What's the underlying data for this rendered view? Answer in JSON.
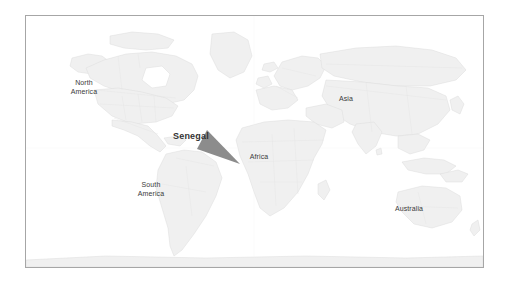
{
  "figure": {
    "kind": "world-locator-map",
    "background_color": "#ffffff",
    "frame": {
      "border_color": "#a6a6a6",
      "fill_color": "#ffffff",
      "x": 25,
      "y": 15,
      "width": 459,
      "height": 253
    }
  },
  "map": {
    "land_fill": "#f0f0f0",
    "land_stroke": "#dcdcdc",
    "border_stroke": "#e4e4e4",
    "projection_note": "equirectangular world map"
  },
  "labels": [
    {
      "id": "north-america",
      "text": "North\nAmerica",
      "x": 83,
      "y": 83
    },
    {
      "id": "south-america",
      "text": "South\nAmerica",
      "x": 150,
      "y": 185
    },
    {
      "id": "africa",
      "text": "Africa",
      "x": 258,
      "y": 157
    },
    {
      "id": "asia",
      "text": "Asia",
      "x": 345,
      "y": 99
    },
    {
      "id": "australia",
      "text": "Australia",
      "x": 408,
      "y": 209
    }
  ],
  "callout": {
    "label": "Senegal",
    "label_x": 173,
    "label_y": 131,
    "label_color": "#333333",
    "arrow_color": "#8c8c8c",
    "arrow_tail_top": {
      "x": 206,
      "y": 130
    },
    "arrow_tail_bottom": {
      "x": 196,
      "y": 148
    },
    "arrow_tip": {
      "x": 239,
      "y": 163
    }
  }
}
